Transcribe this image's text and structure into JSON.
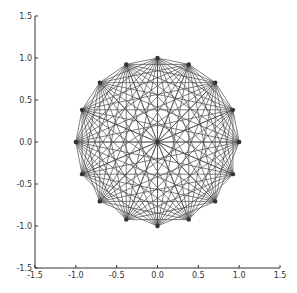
{
  "chart_data": {
    "type": "scatter",
    "title": "",
    "xlabel": "",
    "ylabel": "",
    "xlim": [
      -1.5,
      1.5
    ],
    "ylim": [
      -1.5,
      1.5
    ],
    "grid": false,
    "xticks": [
      "-1.5",
      "-1.0",
      "-0.5",
      "0.0",
      "0.5",
      "1.0",
      "1.5"
    ],
    "yticks": [
      "-1.5",
      "-1.0",
      "-0.5",
      "0.0",
      "0.5",
      "1.0",
      "1.5"
    ],
    "nodes": [
      {
        "x": 0.0,
        "y": 0.0
      },
      {
        "x": 1.0,
        "y": 0.0
      },
      {
        "x": 0.924,
        "y": 0.383
      },
      {
        "x": 0.707,
        "y": 0.707
      },
      {
        "x": 0.383,
        "y": 0.924
      },
      {
        "x": 0.0,
        "y": 1.0
      },
      {
        "x": -0.383,
        "y": 0.924
      },
      {
        "x": -0.707,
        "y": 0.707
      },
      {
        "x": -0.924,
        "y": 0.383
      },
      {
        "x": -1.0,
        "y": 0.0
      },
      {
        "x": -0.924,
        "y": -0.383
      },
      {
        "x": -0.707,
        "y": -0.707
      },
      {
        "x": -0.383,
        "y": -0.924
      },
      {
        "x": 0.0,
        "y": -1.0
      },
      {
        "x": 0.383,
        "y": -0.924
      },
      {
        "x": 0.707,
        "y": -0.707
      },
      {
        "x": 0.924,
        "y": -0.383
      }
    ],
    "omitted_edges": [
      [
        10,
        11
      ],
      [
        11,
        12
      ],
      [
        12,
        13
      ],
      [
        13,
        14
      ],
      [
        14,
        15
      ],
      [
        15,
        16
      ],
      [
        16,
        1
      ]
    ],
    "edge_color": "#444444",
    "node_color": "#333333"
  }
}
